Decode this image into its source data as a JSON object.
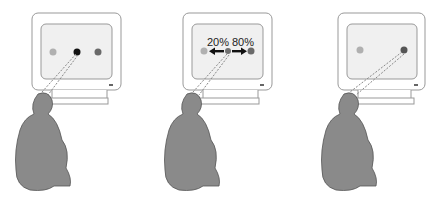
{
  "figure": {
    "panels": [
      {
        "id": "panel-1",
        "description": "monkey fixating center target",
        "dots": {
          "left": "#b0b0b0",
          "center": "#111111",
          "right": "#6a6a6a"
        },
        "gaze_target": "center"
      },
      {
        "id": "panel-2",
        "description": "center dot with arrows indicating choice probabilities",
        "dots": {
          "left": "#b0b0b0",
          "center": "#707070",
          "right": "#6a6a6a"
        },
        "labels": {
          "left_pct": "20%",
          "right_pct": "80%"
        },
        "gaze_target": "center"
      },
      {
        "id": "panel-3",
        "description": "monkey saccades to right target",
        "dots": {
          "left": "#b0b0b0",
          "right": "#555555"
        },
        "gaze_target": "right"
      }
    ],
    "colors": {
      "monkey": "#8a8a8a",
      "screen": "#f0f0f0",
      "monitor": "#ffffff",
      "outline": "#999999"
    }
  }
}
